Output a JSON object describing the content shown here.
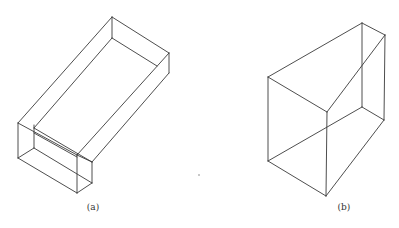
{
  "figures": [
    {
      "id": "a",
      "caption": "(a)",
      "caption_pos": [
        93,
        202
      ],
      "description": "Isometric wireframe of a long rectangular box with a stepped (taller) front end",
      "edges": [
        [
          112,
          17,
          169,
          53
        ],
        [
          112,
          17,
          112,
          38
        ],
        [
          169,
          53,
          169,
          73
        ],
        [
          112,
          38,
          157,
          66
        ],
        [
          112,
          17,
          18,
          123
        ],
        [
          169,
          53,
          77,
          155
        ],
        [
          169,
          73,
          92,
          162
        ],
        [
          112,
          38,
          34,
          128
        ],
        [
          18,
          123,
          77,
          155
        ],
        [
          34,
          128,
          92,
          162
        ],
        [
          34,
          133,
          77,
          157
        ],
        [
          18,
          123,
          18,
          158
        ],
        [
          34,
          125,
          34,
          148
        ],
        [
          18,
          158,
          34,
          148
        ],
        [
          18,
          158,
          77,
          193
        ],
        [
          34,
          148,
          92,
          183
        ],
        [
          77,
          155,
          77,
          193
        ],
        [
          77,
          155,
          92,
          162
        ],
        [
          92,
          162,
          92,
          183
        ],
        [
          77,
          193,
          92,
          183
        ]
      ]
    },
    {
      "id": "b",
      "caption": "(b)",
      "caption_pos": [
        344,
        202
      ],
      "description": "Isometric wireframe of a wedge-shaped prism",
      "edges": [
        [
          268,
          77,
          362,
          23
        ],
        [
          362,
          23,
          385,
          35
        ],
        [
          268,
          77,
          327,
          112
        ],
        [
          327,
          112,
          385,
          35
        ],
        [
          362,
          23,
          362,
          107
        ],
        [
          268,
          77,
          268,
          161
        ],
        [
          327,
          112,
          326,
          196
        ],
        [
          268,
          161,
          326,
          196
        ],
        [
          326,
          196,
          384,
          120
        ],
        [
          385,
          35,
          384,
          120
        ],
        [
          362,
          107,
          384,
          120
        ],
        [
          268,
          161,
          362,
          107
        ]
      ]
    }
  ],
  "specks": [
    [
      199,
      175
    ]
  ],
  "colors": {
    "line": "#3a3a3a",
    "background": "#ffffff",
    "text": "#333333"
  }
}
